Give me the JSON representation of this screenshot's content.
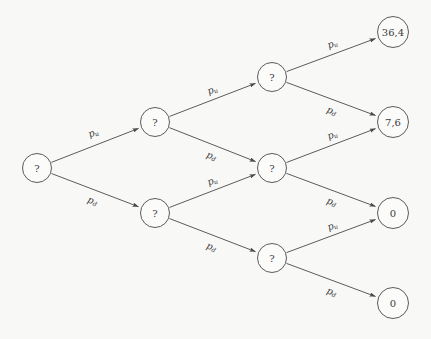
{
  "diagram": {
    "background_color": "#f8f8f7",
    "stroke_color": "#4a4a4a",
    "text_color": "#3a3a3a",
    "node_radius": 14.5,
    "terminal_node_radius": 15.5,
    "labels": {
      "up": {
        "base": "p",
        "sub": "u"
      },
      "down": {
        "base": "p",
        "sub": "d"
      }
    },
    "nodes": [
      {
        "id": "n0",
        "label": "?",
        "kind": "unknown",
        "level": 0,
        "x": 37,
        "y": 168,
        "r": 14.5
      },
      {
        "id": "n1u",
        "label": "?",
        "kind": "unknown",
        "level": 1,
        "x": 155,
        "y": 122,
        "r": 14.5
      },
      {
        "id": "n1d",
        "label": "?",
        "kind": "unknown",
        "level": 1,
        "x": 155,
        "y": 213,
        "r": 14.5
      },
      {
        "id": "n2uu",
        "label": "?",
        "kind": "unknown",
        "level": 2,
        "x": 272,
        "y": 77,
        "r": 14.5
      },
      {
        "id": "n2ud",
        "label": "?",
        "kind": "unknown",
        "level": 2,
        "x": 272,
        "y": 168,
        "r": 14.5
      },
      {
        "id": "n2dd",
        "label": "?",
        "kind": "unknown",
        "level": 2,
        "x": 272,
        "y": 258,
        "r": 14.5
      },
      {
        "id": "t0",
        "label": "36,4",
        "kind": "terminal",
        "level": 3,
        "x": 393,
        "y": 32,
        "r": 15.5
      },
      {
        "id": "t1",
        "label": "7,6",
        "kind": "terminal",
        "level": 3,
        "x": 393,
        "y": 122,
        "r": 15.5
      },
      {
        "id": "t2",
        "label": "0",
        "kind": "terminal",
        "level": 3,
        "x": 393,
        "y": 213,
        "r": 15.5
      },
      {
        "id": "t3",
        "label": "0",
        "kind": "terminal",
        "level": 3,
        "x": 393,
        "y": 303,
        "r": 15.5
      }
    ],
    "edges": [
      {
        "id": "e0",
        "from": "n0",
        "to": "n1u",
        "move": "up",
        "label_x": 93,
        "label_y": 132
      },
      {
        "id": "e1",
        "from": "n0",
        "to": "n1d",
        "move": "down",
        "label_x": 93,
        "label_y": 200
      },
      {
        "id": "e2",
        "from": "n1u",
        "to": "n2uu",
        "move": "up",
        "label_x": 212,
        "label_y": 89
      },
      {
        "id": "e3",
        "from": "n1u",
        "to": "n2ud",
        "move": "down",
        "label_x": 212,
        "label_y": 155
      },
      {
        "id": "e4",
        "from": "n1d",
        "to": "n2ud",
        "move": "up",
        "label_x": 212,
        "label_y": 180
      },
      {
        "id": "e5",
        "from": "n1d",
        "to": "n2dd",
        "move": "down",
        "label_x": 212,
        "label_y": 246
      },
      {
        "id": "e6",
        "from": "n2uu",
        "to": "t0",
        "move": "up",
        "label_x": 332,
        "label_y": 43
      },
      {
        "id": "e7",
        "from": "n2uu",
        "to": "t1",
        "move": "down",
        "label_x": 332,
        "label_y": 110
      },
      {
        "id": "e8",
        "from": "n2ud",
        "to": "t1",
        "move": "up",
        "label_x": 332,
        "label_y": 134
      },
      {
        "id": "e9",
        "from": "n2ud",
        "to": "t2",
        "move": "down",
        "label_x": 332,
        "label_y": 201
      },
      {
        "id": "e10",
        "from": "n2dd",
        "to": "t2",
        "move": "up",
        "label_x": 332,
        "label_y": 225
      },
      {
        "id": "e11",
        "from": "n2dd",
        "to": "t3",
        "move": "down",
        "label_x": 332,
        "label_y": 291
      }
    ]
  }
}
